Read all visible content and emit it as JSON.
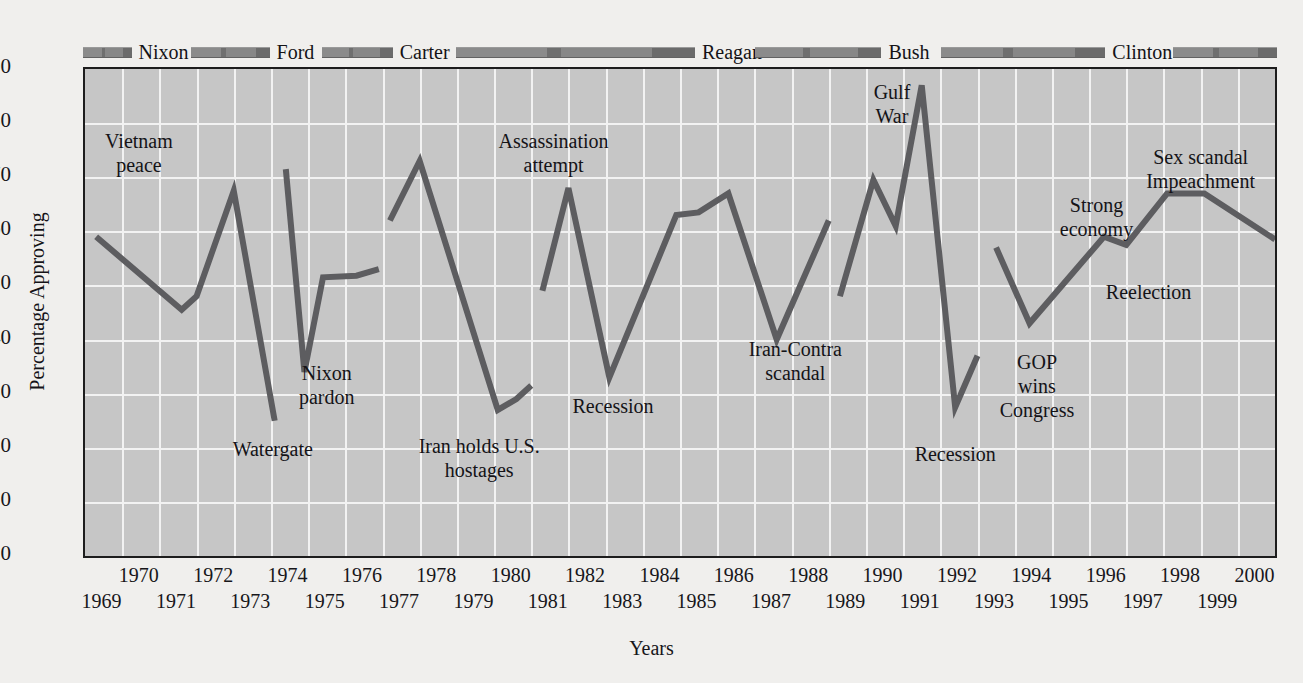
{
  "axes": {
    "ylabel": "Percentage Approving",
    "xlabel": "Years",
    "yticks": [
      "0",
      "10",
      "20",
      "30",
      "40",
      "50",
      "60",
      "70",
      "80",
      "90"
    ],
    "xticks_upper": [
      "1970",
      "1972",
      "1974",
      "1976",
      "1978",
      "1980",
      "1982",
      "1984",
      "1986",
      "1988",
      "1990",
      "1992",
      "1994",
      "1996",
      "1998",
      "2000"
    ],
    "xticks_lower": [
      "1969",
      "1971",
      "1973",
      "1975",
      "1977",
      "1979",
      "1981",
      "1983",
      "1985",
      "1987",
      "1989",
      "1991",
      "1993",
      "1995",
      "1997",
      "1999"
    ]
  },
  "legend": {
    "items": [
      {
        "label": "Nixon",
        "bar_start_year": 1969.0,
        "bar_end_year": 1970.3
      },
      {
        "label": "Ford",
        "bar_start_year": 1971.9,
        "bar_end_year": 1974.0
      },
      {
        "label": "Carter",
        "bar_start_year": 1975.4,
        "bar_end_year": 1977.3
      },
      {
        "label": "Reagan",
        "bar_start_year": 1979.0,
        "bar_end_year": 1985.4
      },
      {
        "label": "Bush",
        "bar_start_year": 1987.0,
        "bar_end_year": 1990.4
      },
      {
        "label": "Clinton",
        "bar_start_year": 1992.0,
        "bar_end_year": 1996.4
      },
      {
        "label": "",
        "bar_start_year": 1998.2,
        "bar_end_year": 2001.0
      }
    ]
  },
  "colors": {
    "plot_background": "#c6c6c6",
    "gridline": "#f2f2f2",
    "line": "#5d5d60",
    "frame": "#1d1d1d",
    "page_background": "#f0efed",
    "legend_bar": "#7c7c7c"
  },
  "annotations": [
    {
      "name": "vietnam-peace",
      "text": "Vietnam\npeace",
      "x": 1970.45,
      "y": 79.0,
      "align": "center"
    },
    {
      "name": "watergate",
      "text": "Watergate",
      "x": 1974.05,
      "y": 22.0,
      "align": "center"
    },
    {
      "name": "nixon-pardon",
      "text": "Nixon\npardon",
      "x": 1975.5,
      "y": 36.0,
      "align": "center"
    },
    {
      "name": "iran-hostages",
      "text": "Iran holds U.S.\nhostages",
      "x": 1979.6,
      "y": 22.5,
      "align": "center"
    },
    {
      "name": "assassination-attempt",
      "text": "Assassination\nattempt",
      "x": 1981.6,
      "y": 79.0,
      "align": "center"
    },
    {
      "name": "recession-1982",
      "text": "Recession",
      "x": 1983.2,
      "y": 30.0,
      "align": "center"
    },
    {
      "name": "iran-contra",
      "text": "Iran-Contra\nscandal",
      "x": 1988.1,
      "y": 40.5,
      "align": "center"
    },
    {
      "name": "gulf-war",
      "text": "Gulf\nWar",
      "x": 1990.7,
      "y": 88.0,
      "align": "center"
    },
    {
      "name": "recession-1992",
      "text": "Recession",
      "x": 1992.4,
      "y": 21.0,
      "align": "center"
    },
    {
      "name": "gop-wins-congress",
      "text": "GOP\nwins\nCongress",
      "x": 1994.6,
      "y": 38.0,
      "align": "center"
    },
    {
      "name": "strong-economy",
      "text": "Strong\neconomy",
      "x": 1996.2,
      "y": 67.0,
      "align": "center"
    },
    {
      "name": "reelection",
      "text": "Reelection",
      "x": 1997.6,
      "y": 51.0,
      "align": "center"
    },
    {
      "name": "sex-scandal-impeachment",
      "text": "Sex scandal\nImpeachment",
      "x": 1999.0,
      "y": 76.0,
      "align": "center"
    }
  ],
  "chart_data": {
    "type": "line",
    "title": "",
    "xlabel": "Years",
    "ylabel": "Percentage Approving",
    "xlim": [
      1969,
      2001
    ],
    "ylim": [
      0,
      90
    ],
    "grid": true,
    "legend_position": "top",
    "series": [
      {
        "name": "Nixon",
        "color": "#5d5d60",
        "points": [
          {
            "x": 1969.3,
            "y": 59.0
          },
          {
            "x": 1971.6,
            "y": 45.5
          },
          {
            "x": 1972.0,
            "y": 48.0
          },
          {
            "x": 1973.0,
            "y": 67.5
          },
          {
            "x": 1974.1,
            "y": 25.0
          }
        ]
      },
      {
        "name": "Ford",
        "color": "#5d5d60",
        "points": [
          {
            "x": 1974.4,
            "y": 71.5
          },
          {
            "x": 1974.9,
            "y": 34.0
          },
          {
            "x": 1975.4,
            "y": 51.5
          },
          {
            "x": 1976.3,
            "y": 51.8
          },
          {
            "x": 1976.9,
            "y": 53.0
          }
        ]
      },
      {
        "name": "Carter",
        "color": "#5d5d60",
        "points": [
          {
            "x": 1977.2,
            "y": 62.0
          },
          {
            "x": 1978.0,
            "y": 73.0
          },
          {
            "x": 1980.1,
            "y": 27.0
          },
          {
            "x": 1980.6,
            "y": 29.0
          },
          {
            "x": 1981.0,
            "y": 31.5
          }
        ]
      },
      {
        "name": "Reagan",
        "color": "#5d5d60",
        "points": [
          {
            "x": 1981.3,
            "y": 49.0
          },
          {
            "x": 1982.0,
            "y": 68.0
          },
          {
            "x": 1983.1,
            "y": 33.0
          },
          {
            "x": 1984.9,
            "y": 63.0
          },
          {
            "x": 1985.5,
            "y": 63.5
          },
          {
            "x": 1986.3,
            "y": 67.0
          },
          {
            "x": 1987.6,
            "y": 40.0
          },
          {
            "x": 1989.0,
            "y": 62.0
          }
        ]
      },
      {
        "name": "Bush",
        "color": "#5d5d60",
        "points": [
          {
            "x": 1989.3,
            "y": 48.0
          },
          {
            "x": 1990.2,
            "y": 69.5
          },
          {
            "x": 1990.8,
            "y": 61.0
          },
          {
            "x": 1991.5,
            "y": 87.0
          },
          {
            "x": 1992.4,
            "y": 27.5
          },
          {
            "x": 1993.0,
            "y": 37.0
          }
        ]
      },
      {
        "name": "Clinton",
        "color": "#5d5d60",
        "points": [
          {
            "x": 1993.5,
            "y": 57.0
          },
          {
            "x": 1994.4,
            "y": 43.0
          },
          {
            "x": 1996.4,
            "y": 59.0
          },
          {
            "x": 1997.0,
            "y": 57.5
          },
          {
            "x": 1998.1,
            "y": 67.0
          },
          {
            "x": 1999.1,
            "y": 67.0
          },
          {
            "x": 2001.0,
            "y": 58.5
          }
        ]
      }
    ]
  }
}
